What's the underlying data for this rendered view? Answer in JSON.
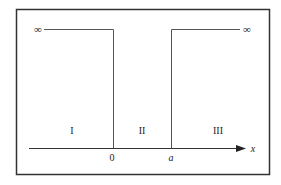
{
  "diagram": {
    "type": "potential-well",
    "colors": {
      "frame": "#333333",
      "lines": "#555555",
      "text": "#222222",
      "background": "#ffffff"
    },
    "infinity_left": "∞",
    "infinity_right": "∞",
    "regions": [
      {
        "id": "region-1",
        "label": "I"
      },
      {
        "id": "region-2",
        "label": "II"
      },
      {
        "id": "region-3",
        "label": "III"
      }
    ],
    "axis": {
      "label": "x",
      "ticks": [
        {
          "label": "0"
        },
        {
          "label": "a"
        }
      ]
    }
  }
}
